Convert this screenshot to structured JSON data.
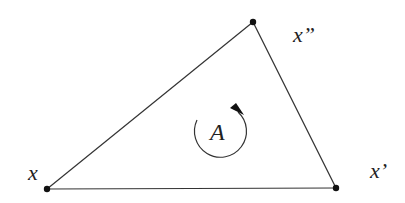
{
  "diagram": {
    "type": "triangle",
    "vertices": [
      {
        "id": "x",
        "label": "x",
        "pos": [
          47,
          189
        ]
      },
      {
        "id": "x1",
        "label": "x’",
        "pos": [
          336,
          188
        ]
      },
      {
        "id": "x2",
        "label": "x”",
        "pos": [
          253,
          22
        ]
      }
    ],
    "center_label": "A",
    "orientation": "counter-clockwise",
    "colors": {
      "line": "#333333",
      "point": "#111111"
    }
  }
}
